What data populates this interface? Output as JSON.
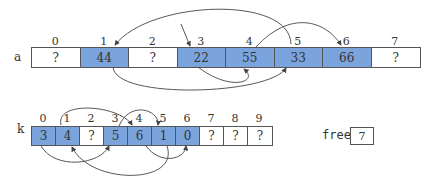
{
  "array_a": {
    "name": "a",
    "indices": [
      "0",
      "1",
      "2",
      "3",
      "4",
      "5",
      "6",
      "7"
    ],
    "cells": [
      {
        "value": "?",
        "used": false
      },
      {
        "value": "44",
        "used": true
      },
      {
        "value": "?",
        "used": false
      },
      {
        "value": "22",
        "used": true
      },
      {
        "value": "55",
        "used": true
      },
      {
        "value": "33",
        "used": true
      },
      {
        "value": "66",
        "used": true
      },
      {
        "value": "?",
        "used": false
      }
    ]
  },
  "array_k": {
    "name": "k",
    "indices": [
      "0",
      "1",
      "2",
      "3",
      "4",
      "5",
      "6",
      "7",
      "8",
      "9"
    ],
    "cells": [
      {
        "value": "3",
        "used": true
      },
      {
        "value": "4",
        "used": true
      },
      {
        "value": "?",
        "used": false
      },
      {
        "value": "5",
        "used": true
      },
      {
        "value": "6",
        "used": true
      },
      {
        "value": "1",
        "used": true
      },
      {
        "value": "0",
        "used": true
      },
      {
        "value": "?",
        "used": false
      },
      {
        "value": "?",
        "used": false
      },
      {
        "value": "?",
        "used": false
      }
    ]
  },
  "free": {
    "label": "free",
    "value": "7"
  },
  "colors": {
    "used": "#7ba4dc",
    "border": "#555555",
    "arrow": "#444444"
  }
}
